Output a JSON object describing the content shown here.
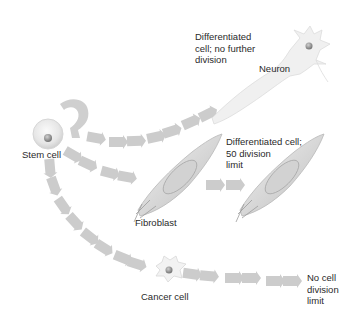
{
  "diagram": {
    "nodes": {
      "stem_cell": {
        "label": "Stem cell"
      },
      "neuron": {
        "label": "Neuron",
        "description": [
          "Differentiated",
          "cell; no further",
          "division"
        ]
      },
      "fibroblast": {
        "label": "Fibroblast",
        "description": [
          "Differentiated cell;",
          "50 division",
          "limit"
        ]
      },
      "cancer_cell": {
        "label": "Cancer cell",
        "description": [
          "No cell",
          "division",
          "limit"
        ]
      }
    },
    "edges": [
      {
        "from": "stem_cell",
        "to": "stem_cell",
        "type": "self-renewal loop"
      },
      {
        "from": "stem_cell",
        "to": "neuron"
      },
      {
        "from": "stem_cell",
        "to": "fibroblast"
      },
      {
        "from": "fibroblast",
        "to": "fibroblast",
        "type": "division"
      },
      {
        "from": "stem_cell",
        "to": "cancer_cell"
      },
      {
        "from": "cancer_cell",
        "to": "no_limit"
      }
    ],
    "colors": {
      "arrow": "#c9c9c9",
      "cell_fill": "#ececec",
      "nucleus": "#9a9a9a",
      "text": "#2a2a2a"
    }
  }
}
